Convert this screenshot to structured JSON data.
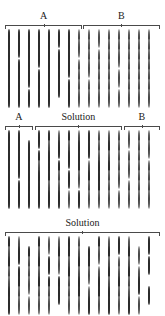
{
  "figure": {
    "title_absent": true,
    "colors": {
      "filled": "#3a3a3a",
      "open_stroke": "#4a4a4a",
      "background": "#ffffff",
      "text": "#1a1a1a"
    },
    "legend_note": "filled = black disc, open = white circle outline"
  },
  "panels": [
    {
      "id": "panel-top",
      "labels": [
        {
          "text": "A",
          "left_pct": 3,
          "width_pct": 47
        },
        {
          "text": "B",
          "left_pct": 50,
          "width_pct": 47
        }
      ],
      "rows": 7,
      "cols": 15,
      "grid": [
        [
          "f",
          "f",
          "f",
          "f",
          "f",
          "f",
          "f",
          "o",
          "o",
          "o",
          "o",
          "o",
          "o",
          "o",
          "o"
        ],
        [
          "f",
          "f",
          "f",
          "f",
          "f",
          "b",
          "f",
          "o",
          "o",
          "b",
          "o",
          "o",
          "o",
          "o",
          "o"
        ],
        [
          "f",
          "b",
          "f",
          "f",
          "f",
          "f",
          "f",
          "b",
          "o",
          "o",
          "o",
          "o",
          "o",
          "o",
          "o"
        ],
        [
          "f",
          "f",
          "f",
          "b",
          "f",
          "f",
          "f",
          "o",
          "o",
          "o",
          "o",
          "b",
          "o",
          "o",
          "o"
        ],
        [
          "f",
          "f",
          "f",
          "f",
          "f",
          "f",
          "b",
          "o",
          "b",
          "o",
          "o",
          "o",
          "o",
          "o",
          "o"
        ],
        [
          "f",
          "f",
          "b",
          "f",
          "f",
          "f",
          "f",
          "o",
          "o",
          "o",
          "o",
          "b",
          "o",
          "o",
          "o"
        ],
        [
          "f",
          "f",
          "f",
          "f",
          "f",
          "b",
          "f",
          "o",
          "o",
          "o",
          "o",
          "o",
          "o",
          "o",
          "o"
        ]
      ]
    },
    {
      "id": "panel-middle",
      "labels": [
        {
          "text": "A",
          "left_pct": 3,
          "width_pct": 17
        },
        {
          "text": "Solution",
          "left_pct": 21,
          "width_pct": 53
        },
        {
          "text": "B",
          "left_pct": 75,
          "width_pct": 22
        }
      ],
      "rows": 7,
      "cols": 15,
      "grid": [
        [
          "f",
          "f",
          "b",
          "f",
          "f",
          "o",
          "f",
          "o",
          "f",
          "o",
          "o",
          "o",
          "o",
          "o",
          "o"
        ],
        [
          "f",
          "f",
          "f",
          "b",
          "o",
          "f",
          "o",
          "f",
          "f",
          "o",
          "f",
          "o",
          "b",
          "o",
          "o"
        ],
        [
          "f",
          "f",
          "f",
          "f",
          "f",
          "b",
          "f",
          "f",
          "b",
          "o",
          "o",
          "o",
          "o",
          "o",
          "b"
        ],
        [
          "f",
          "f",
          "f",
          "o",
          "f",
          "f",
          "b",
          "f",
          "o",
          "f",
          "f",
          "o",
          "o",
          "o",
          "o"
        ],
        [
          "f",
          "b",
          "f",
          "f",
          "f",
          "o",
          "f",
          "o",
          "f",
          "f",
          "o",
          "o",
          "b",
          "o",
          "o"
        ],
        [
          "f",
          "f",
          "f",
          "f",
          "o",
          "o",
          "b",
          "b",
          "o",
          "f",
          "o",
          "b",
          "o",
          "o",
          "o"
        ],
        [
          "f",
          "f",
          "f",
          "f",
          "f",
          "f",
          "o",
          "f",
          "o",
          "o",
          "o",
          "o",
          "o",
          "o",
          "o"
        ]
      ]
    },
    {
      "id": "panel-bottom",
      "labels": [
        {
          "text": "Solution",
          "left_pct": 3,
          "width_pct": 94
        }
      ],
      "rows": 7,
      "cols": 15,
      "grid": [
        [
          "f",
          "o",
          "b",
          "f",
          "o",
          "o",
          "f",
          "o",
          "b",
          "f",
          "o",
          "f",
          "o",
          "b",
          "f"
        ],
        [
          "o",
          "f",
          "f",
          "o",
          "b",
          "f",
          "f",
          "o",
          "f",
          "o",
          "f",
          "b",
          "f",
          "o",
          "b"
        ],
        [
          "f",
          "b",
          "o",
          "f",
          "f",
          "o",
          "o",
          "f",
          "f",
          "b",
          "o",
          "o",
          "o",
          "b",
          "f"
        ],
        [
          "o",
          "f",
          "o",
          "o",
          "b",
          "b",
          "f",
          "o",
          "o",
          "o",
          "f",
          "o",
          "f",
          "o",
          "b"
        ],
        [
          "o",
          "f",
          "o",
          "f",
          "f",
          "f",
          "o",
          "f",
          "b",
          "f",
          "o",
          "f",
          "o",
          "f",
          "b"
        ],
        [
          "f",
          "o",
          "b",
          "o",
          "o",
          "f",
          "o",
          "f",
          "o",
          "f",
          "f",
          "o",
          "o",
          "b",
          "f"
        ],
        [
          "f",
          "o",
          "o",
          "o",
          "o",
          "b",
          "o",
          "o",
          "f",
          "o",
          "f",
          "o",
          "f",
          "o",
          "b"
        ]
      ]
    }
  ]
}
